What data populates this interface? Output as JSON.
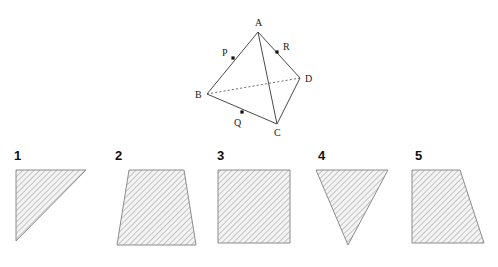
{
  "figure": {
    "type": "geometry-diagram",
    "top_solid": {
      "name": "tetrahedron-ABCD",
      "vertices": [
        {
          "id": "A",
          "label": "A",
          "x": 258,
          "y": 32,
          "label_x": 255,
          "label_y": 26
        },
        {
          "id": "B",
          "label": "B",
          "x": 207,
          "y": 94,
          "label_x": 195,
          "label_y": 98
        },
        {
          "id": "C",
          "label": "C",
          "x": 277,
          "y": 124,
          "label_x": 274,
          "label_y": 136
        },
        {
          "id": "D",
          "label": "D",
          "x": 300,
          "y": 78,
          "label_x": 305,
          "label_y": 82
        }
      ],
      "solid_edges": [
        {
          "name": "edge-AB",
          "from": "A",
          "to": "B"
        },
        {
          "name": "edge-AC",
          "from": "A",
          "to": "C"
        },
        {
          "name": "edge-AD",
          "from": "A",
          "to": "D"
        },
        {
          "name": "edge-BC",
          "from": "B",
          "to": "C"
        },
        {
          "name": "edge-CD",
          "from": "C",
          "to": "D"
        }
      ],
      "dashed_edges": [
        {
          "name": "edge-BD",
          "from": "B",
          "to": "D"
        }
      ],
      "marked_points": [
        {
          "id": "P",
          "label": "P",
          "on_edge": "AB",
          "x": 233,
          "y": 58,
          "label_x": 222,
          "label_y": 56
        },
        {
          "id": "Q",
          "label": "Q",
          "on_edge": "BC",
          "x": 242,
          "y": 112,
          "label_x": 234,
          "label_y": 126
        },
        {
          "id": "R",
          "label": "R",
          "on_edge": "AD",
          "x": 277,
          "y": 52,
          "label_x": 283,
          "label_y": 50
        }
      ]
    },
    "answer_shapes": [
      {
        "number": "1",
        "name": "shape-right-triangle",
        "shape_type": "right triangle",
        "number_x": 14,
        "number_y": 160,
        "points": "16,170 86,170 16,241"
      },
      {
        "number": "2",
        "name": "shape-trapezoid-narrow-top",
        "shape_type": "trapezoid",
        "number_x": 115,
        "number_y": 160,
        "points": "129,170 184,170 196,245 117,245"
      },
      {
        "number": "3",
        "name": "shape-square",
        "shape_type": "square",
        "number_x": 217,
        "number_y": 160,
        "points": "218,170 290,170 290,243 218,243"
      },
      {
        "number": "4",
        "name": "shape-inverted-triangle",
        "shape_type": "triangle",
        "number_x": 318,
        "number_y": 160,
        "points": "316,170 388,170 348,245"
      },
      {
        "number": "5",
        "name": "shape-right-trapezoid",
        "shape_type": "right trapezoid",
        "number_x": 415,
        "number_y": 160,
        "points": "412,170 460,170 484,243 412,243"
      }
    ]
  },
  "style": {
    "background": "#ffffff",
    "edge_color": "#4a4a4a",
    "dashed_edge_color": "#6b6b6b",
    "label_color": "#1a1a1a",
    "shape_outline_color": "#8c8c8c",
    "hatch_color": "#9a9a9a",
    "hatch_fill": "#f2f2f2",
    "hatch_angle_degrees": 45
  }
}
